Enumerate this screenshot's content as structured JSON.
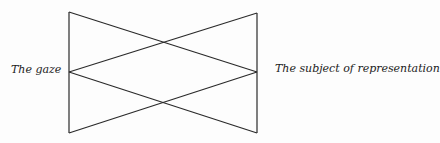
{
  "diagram": {
    "left_label": "The gaze",
    "right_label": "The subject of representation",
    "line_color": "#2a2a2a"
  }
}
